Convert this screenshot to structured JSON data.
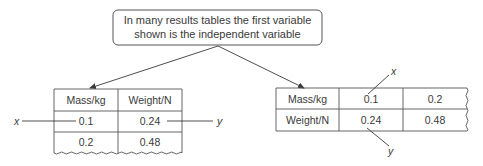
{
  "callout": {
    "line1": "In many results tables the first variable",
    "line2": "shown is the independent variable"
  },
  "left_table": {
    "headers": [
      "Mass/kg",
      "Weight/N"
    ],
    "rows": [
      [
        "0.1",
        "0.24"
      ],
      [
        "0.2",
        "0.48"
      ]
    ],
    "x_label": "x",
    "y_label": "y"
  },
  "right_table": {
    "rows": [
      {
        "label": "Mass/kg",
        "values": [
          "0.1",
          "0.2"
        ]
      },
      {
        "label": "Weight/N",
        "values": [
          "0.24",
          "0.48"
        ]
      }
    ],
    "x_label": "x",
    "y_label": "y"
  },
  "colors": {
    "line": "#3a3a3a",
    "background": "#ffffff"
  }
}
